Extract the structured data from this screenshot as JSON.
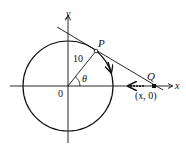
{
  "diagram": {
    "type": "geometry-circle-tangent",
    "colors": {
      "stroke": "#111111",
      "background": "#ffffff"
    },
    "labels": {
      "y_axis": "y",
      "x_axis": "x",
      "origin": "0",
      "point_p": "P",
      "point_q": "Q",
      "radius": "10",
      "angle": "θ",
      "q_coords": "(x, 0)"
    }
  }
}
